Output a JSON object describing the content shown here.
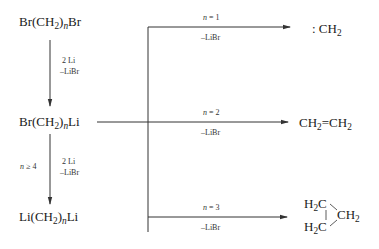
{
  "diagram": {
    "type": "reaction-scheme",
    "species": {
      "dibromide": {
        "pre": "Br(CH",
        "sub": "2",
        "mid": ")",
        "n": "n",
        "post": "Br"
      },
      "bromo_lithio": {
        "pre": "Br(CH",
        "sub": "2",
        "mid": ")",
        "n": "n",
        "post": "Li"
      },
      "dilithio": {
        "pre": "Li(CH",
        "sub": "2",
        "mid": ")",
        "n": "n",
        "post": "Li"
      },
      "carbene": {
        "pre": ": CH",
        "sub": "2"
      },
      "ethylene": {
        "a": "CH",
        "a_sub": "2",
        "bond": "=",
        "b": "CH",
        "b_sub": "2"
      },
      "cyclopropane": {
        "top": "H",
        "top_sub": "2",
        "top_c": "C",
        "bottom": "H",
        "bottom_sub": "2",
        "bottom_c": "C",
        "right": "CH",
        "right_sub": "2"
      }
    },
    "conditions": {
      "step1_reagent": "2 Li",
      "step1_byproduct": "–LiBr",
      "step2_reagent": "2 Li",
      "step2_byproduct": "–LiBr",
      "step2_condition_n": "n",
      "step2_condition_rest": " ≥ 4",
      "branch1_n": "n",
      "branch1_eq": " = 1",
      "branch1_byproduct": "–LiBr",
      "branch2_n": "n",
      "branch2_eq": " = 2",
      "branch2_byproduct": "–LiBr",
      "branch3_n": "n",
      "branch3_eq": " = 3",
      "branch3_byproduct": "–LiBr"
    },
    "line_color": "#333333"
  }
}
